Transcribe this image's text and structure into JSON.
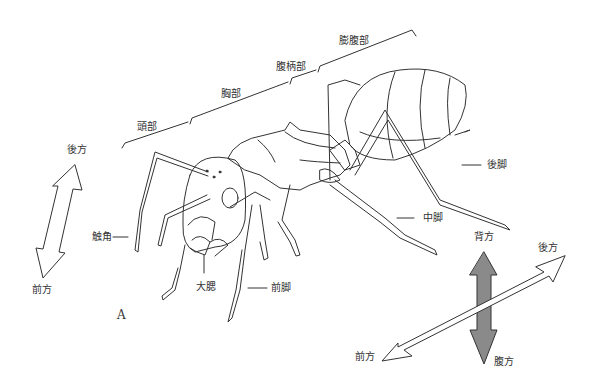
{
  "figure": {
    "panel_label": "A",
    "segments": {
      "head": "頭部",
      "thorax": "胸部",
      "petiole": "腹柄部",
      "gaster": "膨腹部"
    },
    "parts": {
      "antenna": "触角",
      "mandible": "大腮",
      "foreleg": "前脚",
      "midleg": "中脚",
      "hindleg": "後脚"
    },
    "left_axis": {
      "top": "後方",
      "bottom": "前方"
    },
    "right_axes": {
      "dorsal": "背方",
      "ventral": "腹方",
      "posterior": "後方",
      "anterior": "前方",
      "dorsoventral_color": "#8a8a8a"
    },
    "line_color": "#333333"
  }
}
